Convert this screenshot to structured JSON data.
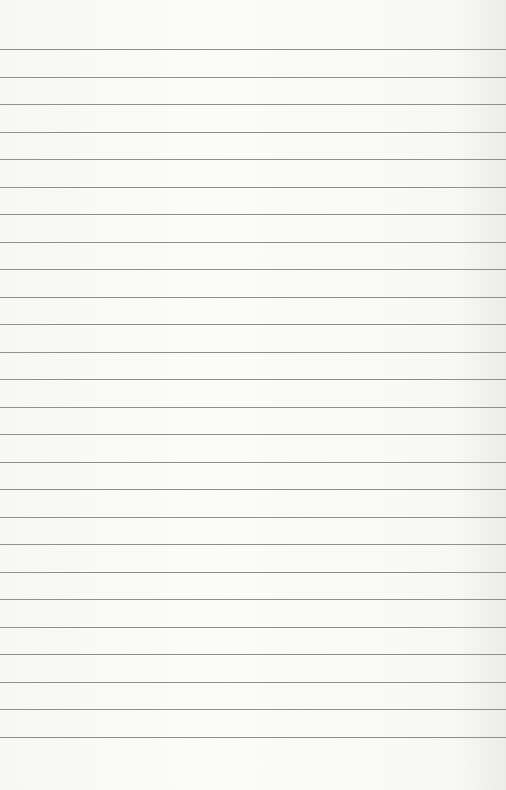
{
  "paper": {
    "background_color": "#f7f7f5",
    "line_color": "#8f8f8d",
    "first_line_y": 49,
    "line_spacing": 27.5,
    "line_count": 26
  }
}
